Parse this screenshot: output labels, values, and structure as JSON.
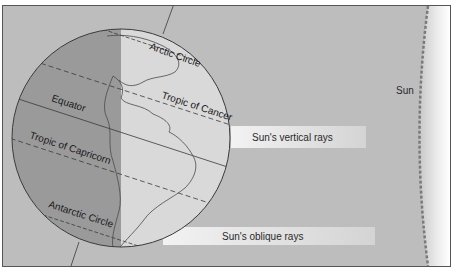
{
  "diagram": {
    "labels": {
      "arctic_circle": "Arctic Circle",
      "tropic_of_cancer": "Tropic of Cancer",
      "equator": "Equator",
      "tropic_of_capricorn": "Tropic of Capricorn",
      "antarctic_circle": "Antarctic Circle",
      "sun": "Sun",
      "vertical_rays": "Sun's vertical rays",
      "oblique_rays": "Sun's oblique rays"
    },
    "colors": {
      "background": "#bdbdbd",
      "night_side": "#9a9a9a",
      "day_side": "#d9d9d9",
      "ray_band": "#e6e6e6",
      "sun_edge": "#7a7a7a",
      "lines": "#3a3a3a"
    }
  }
}
